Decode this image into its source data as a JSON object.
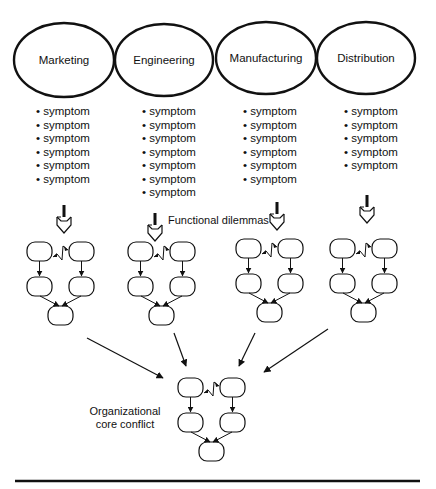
{
  "functions": [
    {
      "name": "Marketing",
      "cx": 64,
      "cy": 60,
      "symptoms": [
        "symptom",
        "symptom",
        "symptom",
        "symptom",
        "symptom",
        "symptom"
      ]
    },
    {
      "name": "Engineering",
      "cx": 164,
      "cy": 60,
      "symptoms": [
        "symptom",
        "symptom",
        "symptom",
        "symptom",
        "symptom",
        "symptom",
        "symptom"
      ]
    },
    {
      "name": "Manufacturing",
      "cx": 266,
      "cy": 58,
      "symptoms": [
        "symptom",
        "symptom",
        "symptom",
        "symptom",
        "symptom",
        "symptom"
      ]
    },
    {
      "name": "Distribution",
      "cx": 366,
      "cy": 58,
      "symptoms": [
        "symptom",
        "symptom",
        "symptom",
        "symptom",
        "symptom"
      ]
    }
  ],
  "labels": {
    "functional_dilemmas": "Functional dilemmas",
    "core_conflict_line1": "Organizational",
    "core_conflict_line2": "core conflict"
  },
  "colors": {
    "stroke": "#111111",
    "background": "#ffffff"
  }
}
